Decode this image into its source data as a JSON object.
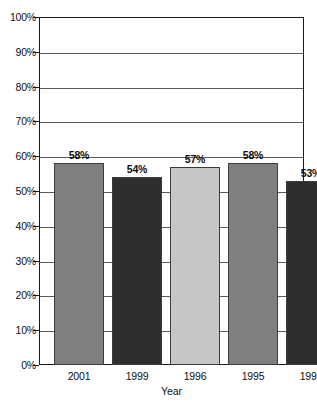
{
  "chart_data": {
    "type": "bar",
    "title": "",
    "xlabel": "Year",
    "ylabel": "",
    "categories": [
      "2001",
      "1999",
      "1996",
      "1995",
      "1993"
    ],
    "values": [
      58,
      54,
      57,
      58,
      53
    ],
    "value_labels": [
      "58%",
      "54%",
      "57%",
      "58%",
      "53%"
    ],
    "ylim": [
      0,
      100
    ],
    "ytick_labels": [
      "100%",
      "90%",
      "80%",
      "70%",
      "60%",
      "50%",
      "40%",
      "30%",
      "20%",
      "10%",
      "0%"
    ],
    "ytick_values": [
      100,
      90,
      80,
      70,
      60,
      50,
      40,
      30,
      20,
      10,
      0
    ],
    "grid": true,
    "legend": "none",
    "bar_colors": [
      "#7f7f7f",
      "#2e2e2e",
      "#c6c6c6",
      "#7f7f7f",
      "#2e2e2e"
    ],
    "frame_color": "#1a1a1a",
    "grid_color": "#5a5a5a",
    "background": "#ffffff"
  }
}
